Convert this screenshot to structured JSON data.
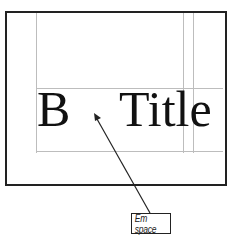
{
  "diagram": {
    "glyphs": {
      "left": "B",
      "right": "Title"
    },
    "callout": {
      "label": "Em space"
    }
  }
}
